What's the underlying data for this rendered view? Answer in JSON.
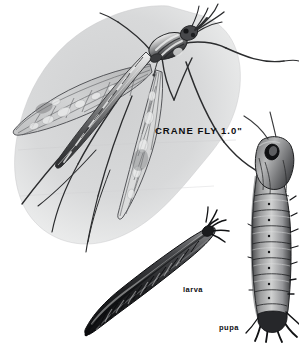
{
  "plate": {
    "subject": "crane fly life stages illustration",
    "background_color": "#ffffff",
    "blob_color": "#d8d9da",
    "ink_color": "#0e0e10"
  },
  "labels": {
    "adult": "CRANE FLY  1.0\"",
    "larva": "larva",
    "pupa": "pupa"
  },
  "figures": [
    {
      "name": "adult-crane-fly",
      "stage": "adult",
      "scale_note": "1.0\""
    },
    {
      "name": "larva",
      "stage": "larva"
    },
    {
      "name": "pupa",
      "stage": "pupa"
    }
  ]
}
